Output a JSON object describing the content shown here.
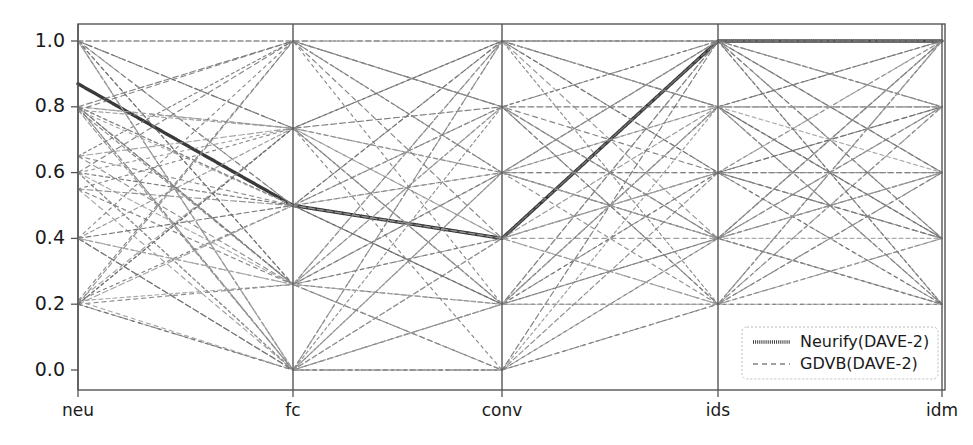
{
  "chart_data": {
    "type": "line",
    "subtype": "parallel-coordinates",
    "title": "",
    "xlabel": "",
    "ylabel": "",
    "grid": false,
    "axes": [
      "neu",
      "fc",
      "conv",
      "ids",
      "idm"
    ],
    "categories": [
      "neu",
      "fc",
      "conv",
      "ids",
      "idm"
    ],
    "ylim": [
      -0.04,
      1.04
    ],
    "yticks": [
      0.0,
      0.2,
      0.4,
      0.6,
      0.8,
      1.0
    ],
    "ytick_labels": [
      "0.0",
      "0.2",
      "0.4",
      "0.6",
      "0.8",
      "1.0"
    ],
    "xtick_labels": [
      "neu",
      "fc",
      "conv",
      "ids",
      "idm"
    ],
    "legend": {
      "position": "lower-right",
      "entries": [
        {
          "label": "Neurify(DAVE-2)",
          "style": "solid-thick",
          "color": "#3a3a3a"
        },
        {
          "label": "GDVB(DAVE-2)",
          "style": "dashed-thin",
          "color": "#808080"
        }
      ]
    },
    "series": [
      {
        "name": "Neurify(DAVE-2)",
        "style": "solid-thick",
        "color": "#3a3a3a",
        "width": 3.4,
        "values": [
          0.87,
          0.5,
          0.4,
          1.0,
          1.0
        ]
      },
      {
        "name": "GDVB(DAVE-2)",
        "style": "dashed-thin",
        "color": "#7a7a7a",
        "values": [
          1.0,
          1.0,
          1.0,
          1.0,
          1.0
        ]
      },
      {
        "name": "GDVB(DAVE-2)",
        "style": "dashed-thin",
        "color": "#8a8a8a",
        "values": [
          1.0,
          0.735,
          1.0,
          1.0,
          1.0
        ]
      },
      {
        "name": "GDVB(DAVE-2)",
        "style": "dashed-thin",
        "color": "#6f6f6f",
        "values": [
          1.0,
          0.735,
          0.8,
          0.8,
          0.8
        ]
      },
      {
        "name": "GDVB(DAVE-2)",
        "style": "dashed-thin",
        "color": "#949494",
        "values": [
          1.0,
          0.5,
          0.6,
          1.0,
          0.6
        ]
      },
      {
        "name": "GDVB(DAVE-2)",
        "style": "dashed-thin",
        "color": "#7f7f7f",
        "values": [
          1.0,
          0.5,
          0.4,
          0.6,
          0.8
        ]
      },
      {
        "name": "GDVB(DAVE-2)",
        "style": "dashed-thin",
        "color": "#8f8f8f",
        "values": [
          1.0,
          0.26,
          0.6,
          0.8,
          0.4
        ]
      },
      {
        "name": "GDVB(DAVE-2)",
        "style": "dashed-thin",
        "color": "#6a6a6a",
        "values": [
          1.0,
          0.26,
          0.2,
          0.4,
          0.2
        ]
      },
      {
        "name": "GDVB(DAVE-2)",
        "style": "dashed-thin",
        "color": "#9a9a9a",
        "values": [
          1.0,
          0.0,
          0.4,
          0.6,
          1.0
        ]
      },
      {
        "name": "GDVB(DAVE-2)",
        "style": "dashed-thin",
        "color": "#858585",
        "values": [
          1.0,
          0.0,
          0.8,
          1.0,
          0.8
        ]
      },
      {
        "name": "GDVB(DAVE-2)",
        "style": "dashed-thin",
        "color": "#747474",
        "values": [
          0.8,
          1.0,
          1.0,
          0.8,
          1.0
        ]
      },
      {
        "name": "GDVB(DAVE-2)",
        "style": "dashed-thin",
        "color": "#8c8c8c",
        "values": [
          0.8,
          0.735,
          0.6,
          1.0,
          0.6
        ]
      },
      {
        "name": "GDVB(DAVE-2)",
        "style": "dashed-thin",
        "color": "#9e9e9e",
        "values": [
          0.8,
          0.735,
          0.4,
          0.6,
          0.4
        ]
      },
      {
        "name": "GDVB(DAVE-2)",
        "style": "dashed-thin",
        "color": "#797979",
        "values": [
          0.8,
          0.5,
          0.8,
          1.0,
          1.0
        ]
      },
      {
        "name": "GDVB(DAVE-2)",
        "style": "dashed-thin",
        "color": "#888888",
        "values": [
          0.8,
          0.5,
          0.2,
          0.4,
          0.6
        ]
      },
      {
        "name": "GDVB(DAVE-2)",
        "style": "dashed-thin",
        "color": "#6e6e6e",
        "values": [
          0.8,
          0.26,
          1.0,
          0.8,
          0.2
        ]
      },
      {
        "name": "GDVB(DAVE-2)",
        "style": "dashed-thin",
        "color": "#a0a0a0",
        "values": [
          0.8,
          0.26,
          0.4,
          0.2,
          0.8
        ]
      },
      {
        "name": "GDVB(DAVE-2)",
        "style": "dashed-thin",
        "color": "#828282",
        "values": [
          0.8,
          0.0,
          0.6,
          0.4,
          1.0
        ]
      },
      {
        "name": "GDVB(DAVE-2)",
        "style": "dashed-thin",
        "color": "#919191",
        "values": [
          0.8,
          0.0,
          0.2,
          0.6,
          0.2
        ]
      },
      {
        "name": "GDVB(DAVE-2)",
        "style": "dashed-thin",
        "color": "#767676",
        "values": [
          0.79,
          1.0,
          0.8,
          0.6,
          0.4
        ]
      },
      {
        "name": "GDVB(DAVE-2)",
        "style": "dashed-thin",
        "color": "#989898",
        "values": [
          0.79,
          0.5,
          1.0,
          1.0,
          0.8
        ]
      },
      {
        "name": "GDVB(DAVE-2)",
        "style": "dashed-thin",
        "color": "#7c7c7c",
        "values": [
          0.79,
          0.26,
          0.8,
          0.2,
          0.6
        ]
      },
      {
        "name": "GDVB(DAVE-2)",
        "style": "dashed-thin",
        "color": "#8e8e8e",
        "values": [
          0.79,
          0.0,
          0.4,
          0.8,
          0.4
        ]
      },
      {
        "name": "GDVB(DAVE-2)",
        "style": "dashed-thin",
        "color": "#717171",
        "values": [
          0.65,
          1.0,
          0.6,
          0.4,
          1.0
        ]
      },
      {
        "name": "GDVB(DAVE-2)",
        "style": "dashed-thin",
        "color": "#9c9c9c",
        "values": [
          0.65,
          0.735,
          0.2,
          1.0,
          0.2
        ]
      },
      {
        "name": "GDVB(DAVE-2)",
        "style": "dashed-thin",
        "color": "#848484",
        "values": [
          0.65,
          0.5,
          0.6,
          0.2,
          0.8
        ]
      },
      {
        "name": "GDVB(DAVE-2)",
        "style": "dashed-thin",
        "color": "#787878",
        "values": [
          0.6,
          1.0,
          0.4,
          1.0,
          0.6
        ]
      },
      {
        "name": "GDVB(DAVE-2)",
        "style": "dashed-thin",
        "color": "#939393",
        "values": [
          0.6,
          0.735,
          1.0,
          0.6,
          1.0
        ]
      },
      {
        "name": "GDVB(DAVE-2)",
        "style": "dashed-thin",
        "color": "#6d6d6d",
        "values": [
          0.6,
          0.5,
          0.2,
          0.8,
          0.4
        ]
      },
      {
        "name": "GDVB(DAVE-2)",
        "style": "dashed-thin",
        "color": "#a2a2a2",
        "values": [
          0.6,
          0.26,
          0.6,
          0.4,
          0.2
        ]
      },
      {
        "name": "GDVB(DAVE-2)",
        "style": "dashed-thin",
        "color": "#808080",
        "values": [
          0.6,
          0.0,
          1.0,
          0.2,
          1.0
        ]
      },
      {
        "name": "GDVB(DAVE-2)",
        "style": "dashed-thin",
        "color": "#8b8b8b",
        "values": [
          0.55,
          0.5,
          0.8,
          0.4,
          0.8
        ]
      },
      {
        "name": "GDVB(DAVE-2)",
        "style": "dashed-thin",
        "color": "#757575",
        "values": [
          0.55,
          0.26,
          0.4,
          1.0,
          0.4
        ]
      },
      {
        "name": "GDVB(DAVE-2)",
        "style": "dashed-thin",
        "color": "#969696",
        "values": [
          0.55,
          0.0,
          0.6,
          0.6,
          0.6
        ]
      },
      {
        "name": "GDVB(DAVE-2)",
        "style": "dashed-thin",
        "color": "#7e7e7e",
        "values": [
          0.4,
          1.0,
          0.2,
          0.2,
          1.0
        ]
      },
      {
        "name": "GDVB(DAVE-2)",
        "style": "dashed-thin",
        "color": "#909090",
        "values": [
          0.4,
          0.735,
          0.6,
          0.8,
          0.2
        ]
      },
      {
        "name": "GDVB(DAVE-2)",
        "style": "dashed-thin",
        "color": "#6b6b6b",
        "values": [
          0.4,
          0.5,
          1.0,
          0.6,
          0.8
        ]
      },
      {
        "name": "GDVB(DAVE-2)",
        "style": "dashed-thin",
        "color": "#9f9f9f",
        "values": [
          0.4,
          0.26,
          0.8,
          0.4,
          0.6
        ]
      },
      {
        "name": "GDVB(DAVE-2)",
        "style": "dashed-thin",
        "color": "#838383",
        "values": [
          0.4,
          0.0,
          0.2,
          1.0,
          0.4
        ]
      },
      {
        "name": "GDVB(DAVE-2)",
        "style": "dashed-thin",
        "color": "#7b7b7b",
        "values": [
          0.21,
          1.0,
          0.8,
          0.2,
          0.4
        ]
      },
      {
        "name": "GDVB(DAVE-2)",
        "style": "dashed-thin",
        "color": "#959595",
        "values": [
          0.21,
          0.735,
          0.4,
          0.4,
          1.0
        ]
      },
      {
        "name": "GDVB(DAVE-2)",
        "style": "dashed-thin",
        "color": "#707070",
        "values": [
          0.21,
          0.5,
          0.2,
          0.6,
          0.2
        ]
      },
      {
        "name": "GDVB(DAVE-2)",
        "style": "dashed-thin",
        "color": "#a1a1a1",
        "values": [
          0.21,
          0.26,
          1.0,
          0.8,
          0.6
        ]
      },
      {
        "name": "GDVB(DAVE-2)",
        "style": "dashed-thin",
        "color": "#878787",
        "values": [
          0.2,
          1.0,
          0.6,
          1.0,
          0.8
        ]
      },
      {
        "name": "GDVB(DAVE-2)",
        "style": "dashed-thin",
        "color": "#777777",
        "values": [
          0.2,
          0.735,
          0.2,
          0.8,
          1.0
        ]
      },
      {
        "name": "GDVB(DAVE-2)",
        "style": "dashed-thin",
        "color": "#999999",
        "values": [
          0.2,
          0.5,
          0.4,
          0.2,
          0.2
        ]
      },
      {
        "name": "GDVB(DAVE-2)",
        "style": "dashed-thin",
        "color": "#7d7d7d",
        "values": [
          0.2,
          0.26,
          0.6,
          0.6,
          0.4
        ]
      },
      {
        "name": "GDVB(DAVE-2)",
        "style": "dashed-thin",
        "color": "#8d8d8d",
        "values": [
          0.2,
          0.0,
          1.0,
          0.4,
          0.6
        ]
      },
      {
        "name": "GDVB(DAVE-2)",
        "style": "dashed-thin",
        "color": "#6c6c6c",
        "values": [
          0.2,
          0.0,
          0.0,
          0.2,
          0.2
        ]
      },
      {
        "name": "GDVB(DAVE-2)",
        "style": "dashed-thin",
        "color": "#a3a3a3",
        "values": [
          1.0,
          0.0,
          0.0,
          0.4,
          0.4
        ]
      },
      {
        "name": "GDVB(DAVE-2)",
        "style": "dashed-thin",
        "color": "#818181",
        "values": [
          0.8,
          0.26,
          0.0,
          0.6,
          0.6
        ]
      },
      {
        "name": "GDVB(DAVE-2)",
        "style": "dashed-thin",
        "color": "#929292",
        "values": [
          0.6,
          0.0,
          0.0,
          0.8,
          0.8
        ]
      },
      {
        "name": "GDVB(DAVE-2)",
        "style": "dashed-thin",
        "color": "#737373",
        "values": [
          0.4,
          0.0,
          0.0,
          1.0,
          1.0
        ]
      },
      {
        "name": "GDVB(DAVE-2)",
        "style": "dashed-thin",
        "color": "#9b9b9b",
        "values": [
          0.21,
          0.0,
          0.2,
          0.2,
          1.0
        ]
      },
      {
        "name": "GDVB(DAVE-2)",
        "style": "dashed-thin",
        "color": "#868686",
        "values": [
          0.65,
          0.26,
          0.0,
          0.2,
          0.6
        ]
      },
      {
        "name": "GDVB(DAVE-2)",
        "style": "dashed-thin",
        "color": "#7a7a7a",
        "values": [
          0.55,
          0.735,
          0.0,
          0.4,
          0.2
        ]
      },
      {
        "name": "GDVB(DAVE-2)",
        "style": "dashed-thin",
        "color": "#979797",
        "values": [
          0.79,
          0.735,
          0.2,
          0.2,
          0.4
        ]
      },
      {
        "name": "GDVB(DAVE-2)",
        "style": "dashed-thin",
        "color": "#898989",
        "values": [
          1.0,
          1.0,
          0.8,
          0.4,
          0.8
        ]
      },
      {
        "name": "GDVB(DAVE-2)",
        "style": "dashed-thin",
        "color": "#6f6f6f",
        "values": [
          0.2,
          0.735,
          1.0,
          1.0,
          0.2
        ]
      },
      {
        "name": "GDVB(DAVE-2)",
        "style": "dashed-thin",
        "color": "#a4a4a4",
        "values": [
          0.4,
          0.26,
          0.2,
          0.8,
          0.8
        ]
      }
    ]
  },
  "axis_style": {
    "spine_color": "#555555",
    "tick_color": "#555555",
    "background": "#ffffff"
  },
  "geometry": {
    "plot_left": 78,
    "plot_right": 945,
    "plot_top": 24,
    "plot_bottom": 390,
    "y_at_one": 41,
    "y_at_zero": 370,
    "axis_x": [
      78,
      293,
      502,
      718,
      942
    ],
    "legend_box": {
      "x": 742,
      "y": 327,
      "w": 196,
      "h": 52
    }
  }
}
